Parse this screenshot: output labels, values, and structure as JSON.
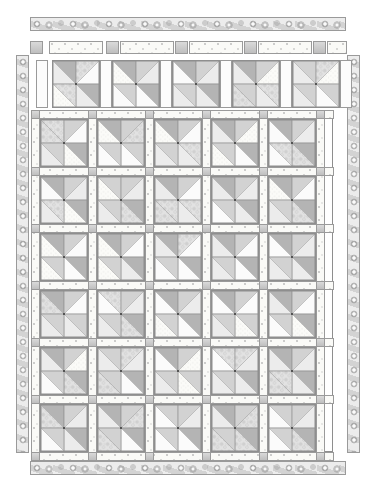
{
  "document": {
    "kind": "quilt-pattern-diagram",
    "title": "Pinwheel Quilt Layout Diagram",
    "canvas": {
      "width": 373,
      "height": 481,
      "background": "#ffffff"
    }
  },
  "palette": {
    "outline": "#8e8e8e",
    "border_print": "#d8d8d8",
    "sashing_dot": "#fafaf7",
    "cornerstone_grey": "#c9c9c9",
    "triangle_dark": "#b4b4b4",
    "triangle_mid": "#d2d2d2",
    "triangle_light": "#ececec",
    "triangle_white": "#fbfbfb",
    "swirl_print": "#e2e2e2",
    "center_dot": "#3a3a3a"
  },
  "borders": {
    "top": {
      "name": "top-border-strip",
      "fabric": "swirl-print",
      "x": 30,
      "y": 17,
      "width": 316,
      "height": 14
    },
    "bottom": {
      "name": "bottom-border-strip",
      "fabric": "swirl-print",
      "x": 30,
      "y": 461,
      "width": 316,
      "height": 14
    },
    "left": {
      "name": "left-border-strip",
      "fabric": "swirl-print",
      "x": 16,
      "y": 55,
      "width": 13,
      "height": 398
    },
    "right": {
      "name": "right-border-strip",
      "fabric": "swirl-print",
      "x": 347,
      "y": 55,
      "width": 13,
      "height": 398
    }
  },
  "component_row": {
    "name": "block-and-sashing-component-row",
    "x": 33,
    "y": 58,
    "width": 300,
    "height": 52,
    "cornerstone": {
      "x": 30,
      "y": 41,
      "size": 13
    },
    "sashing_preview": {
      "x": 49,
      "y": 41,
      "width": 54,
      "height": 13
    },
    "vertical_sash": {
      "x": 36,
      "y": 60,
      "width": 12,
      "height": 48
    },
    "blocks": 5
  },
  "sashing_header": {
    "name": "top-sashing-row",
    "y": 41,
    "cells": [
      {
        "type": "cornerstone",
        "x": 30,
        "w": 13
      },
      {
        "type": "sashing",
        "x": 49,
        "w": 54
      },
      {
        "type": "cornerstone",
        "x": 106,
        "w": 13
      },
      {
        "type": "sashing",
        "x": 120,
        "w": 54
      },
      {
        "type": "cornerstone",
        "x": 175,
        "w": 13
      },
      {
        "type": "sashing",
        "x": 189,
        "w": 54
      },
      {
        "type": "cornerstone",
        "x": 244,
        "w": 13
      },
      {
        "type": "sashing",
        "x": 258,
        "w": 54
      },
      {
        "type": "cornerstone",
        "x": 313,
        "w": 13
      },
      {
        "type": "sashing",
        "x": 327,
        "w": 20
      }
    ]
  },
  "quilt_body": {
    "name": "main-quilt-body",
    "x": 33,
    "y": 112,
    "width": 300,
    "height": 340,
    "columns": 5,
    "rows": 6,
    "block_size": 48,
    "sashing_width": 9,
    "cornerstone_size": 9,
    "outer_margin": 6
  },
  "chart_data": {
    "type": "table",
    "xlabel": "columns",
    "ylabel": "rows",
    "categories": [
      "col-1",
      "col-2",
      "col-3",
      "col-4",
      "col-5"
    ],
    "series": [
      {
        "name": "row-1",
        "values": [
          1,
          1,
          1,
          1,
          1
        ]
      },
      {
        "name": "row-2",
        "values": [
          1,
          1,
          1,
          1,
          1
        ]
      },
      {
        "name": "row-3",
        "values": [
          1,
          1,
          1,
          1,
          1
        ]
      },
      {
        "name": "row-4",
        "values": [
          1,
          1,
          1,
          1,
          1
        ]
      },
      {
        "name": "row-5",
        "values": [
          1,
          1,
          1,
          1,
          1
        ]
      },
      {
        "name": "row-6",
        "values": [
          1,
          1,
          1,
          1,
          1
        ]
      }
    ],
    "legend": [
      "pinwheel-block",
      "dotted-sashing",
      "grey-cornerstone",
      "swirl-border"
    ]
  },
  "block_unit": {
    "name": "pinwheel-block",
    "description": "Four quarter-units, each split diagonally into two triangles, rotating around a centre point.",
    "triangle_count": 8,
    "center_dot": true
  }
}
